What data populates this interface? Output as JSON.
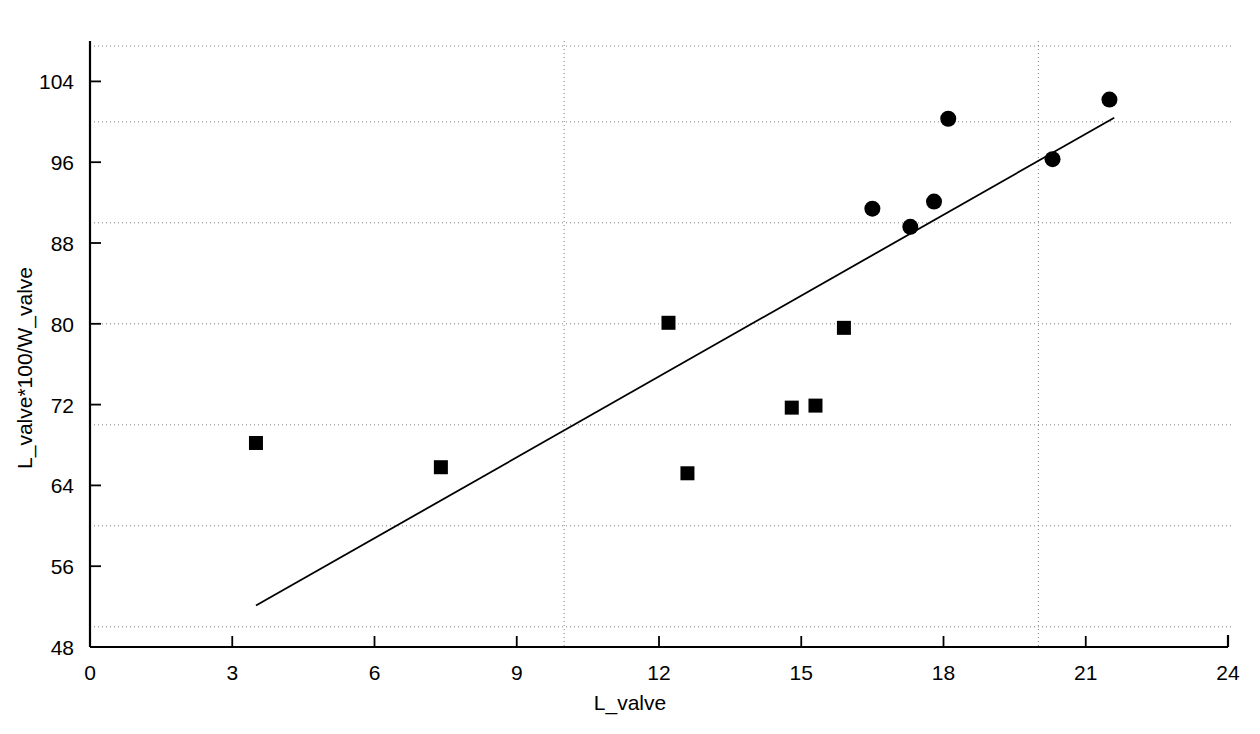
{
  "chart_data": {
    "type": "scatter",
    "title": "",
    "xlabel": "L_valve",
    "ylabel": "L_valve*100/W_valve",
    "xlim": [
      0,
      24
    ],
    "ylim": [
      48,
      108
    ],
    "xticks": [
      0,
      3,
      6,
      9,
      12,
      15,
      18,
      21,
      24
    ],
    "yticks": [
      48,
      56,
      64,
      72,
      80,
      88,
      96,
      104
    ],
    "xtick_labels": [
      "0",
      "3",
      "6",
      "9",
      "12",
      "15",
      "18",
      "21",
      "24"
    ],
    "ytick_labels": [
      "48",
      "56",
      "64",
      "72",
      "80",
      "88",
      "96",
      "104"
    ],
    "grid": true,
    "grid_x_values": [
      10,
      20
    ],
    "grid_y_values": [
      50,
      60,
      70,
      80,
      90,
      100,
      107.5
    ],
    "legend": "none",
    "series": [
      {
        "name": "square-group",
        "marker": "square",
        "color": "#000000",
        "points": [
          {
            "x": 3.5,
            "y": 68.2
          },
          {
            "x": 7.4,
            "y": 65.8
          },
          {
            "x": 12.2,
            "y": 80.1
          },
          {
            "x": 12.6,
            "y": 65.2
          },
          {
            "x": 14.8,
            "y": 71.7
          },
          {
            "x": 15.3,
            "y": 71.9
          },
          {
            "x": 15.9,
            "y": 79.6
          }
        ]
      },
      {
        "name": "circle-group",
        "marker": "circle",
        "color": "#000000",
        "points": [
          {
            "x": 16.5,
            "y": 91.4
          },
          {
            "x": 17.3,
            "y": 89.6
          },
          {
            "x": 17.8,
            "y": 92.1
          },
          {
            "x": 18.1,
            "y": 100.3
          },
          {
            "x": 20.3,
            "y": 96.3
          },
          {
            "x": 21.5,
            "y": 102.2
          }
        ]
      }
    ],
    "trendline": {
      "name": "fit-line",
      "x1": 3.5,
      "y1": 52.1,
      "x2": 21.6,
      "y2": 100.4,
      "color": "#000000"
    }
  }
}
